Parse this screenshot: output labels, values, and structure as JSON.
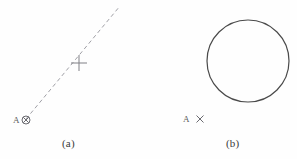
{
  "figure": {
    "background_color": "#fefefe",
    "ink_color": "#4a4a4a",
    "dash_color": "#9a9aa0",
    "panels": [
      {
        "id": "a",
        "caption": "(a)",
        "point_label": "A",
        "marker_symbol": "circle-x",
        "description_items": {
          "dashed_line": {
            "x1": 26,
            "y1": 119,
            "x2": 120,
            "y2": 6,
            "style": "dashed"
          },
          "cross_marker": {
            "cx": 79,
            "cy": 63,
            "arm": 8
          },
          "circled_x_marker": {
            "cx": 26,
            "cy": 120,
            "r": 4
          }
        }
      },
      {
        "id": "b",
        "caption": "(b)",
        "point_label": "A",
        "marker_symbol": "x",
        "description_items": {
          "circle": {
            "cx": 98,
            "cy": 61,
            "r": 41,
            "style": "solid"
          },
          "x_marker": {
            "cx": 50,
            "cy": 119,
            "arm": 4
          }
        }
      }
    ]
  }
}
